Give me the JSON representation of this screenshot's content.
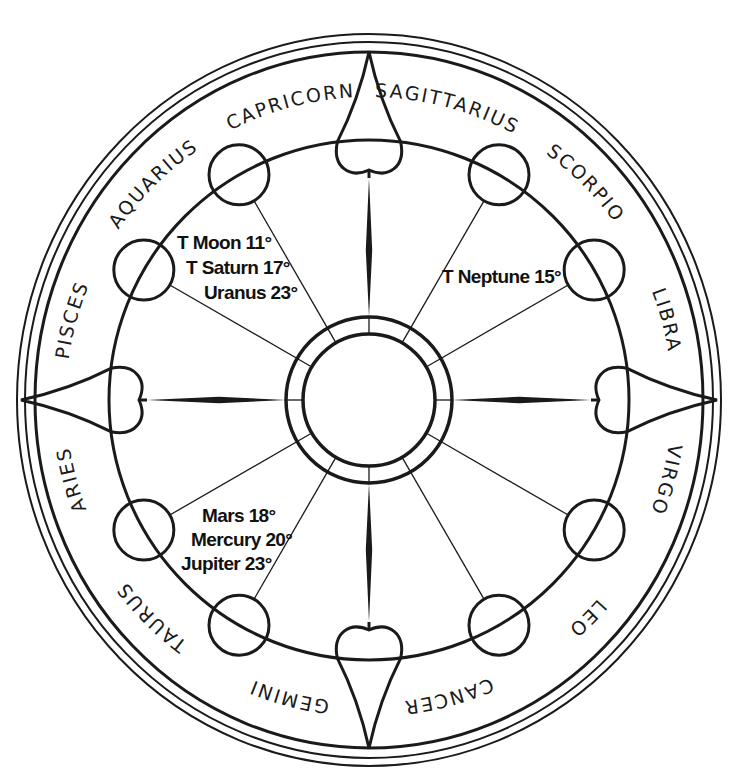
{
  "diagram": {
    "type": "astrological-chart-wheel",
    "center": [
      369,
      400
    ],
    "colors": {
      "line": "#1a1a1a",
      "background": "#ffffff",
      "text": "#111111"
    },
    "signs": [
      {
        "name": "SAGITTARIUS",
        "angle": 15
      },
      {
        "name": "SCORPIO",
        "angle": 45
      },
      {
        "name": "LIBRA",
        "angle": 75
      },
      {
        "name": "VIRGO",
        "angle": 105
      },
      {
        "name": "LEO",
        "angle": 135
      },
      {
        "name": "CANCER",
        "angle": 165
      },
      {
        "name": "GEMINI",
        "angle": 195
      },
      {
        "name": "TAURUS",
        "angle": 225
      },
      {
        "name": "ARIES",
        "angle": 255
      },
      {
        "name": "PISCES",
        "angle": 285
      },
      {
        "name": "AQUARIUS",
        "angle": 315
      },
      {
        "name": "CAPRICORN",
        "angle": 345
      }
    ],
    "planet_groups": [
      {
        "position": "upper-left",
        "lines": [
          "T Moon 11°",
          "T Saturn 17°",
          "Uranus 23°"
        ]
      },
      {
        "position": "upper-right",
        "lines": [
          "T Neptune 15°"
        ]
      },
      {
        "position": "lower-left",
        "lines": [
          "Mars 18°",
          "Mercury 20°",
          "Jupiter 23°"
        ]
      }
    ]
  }
}
